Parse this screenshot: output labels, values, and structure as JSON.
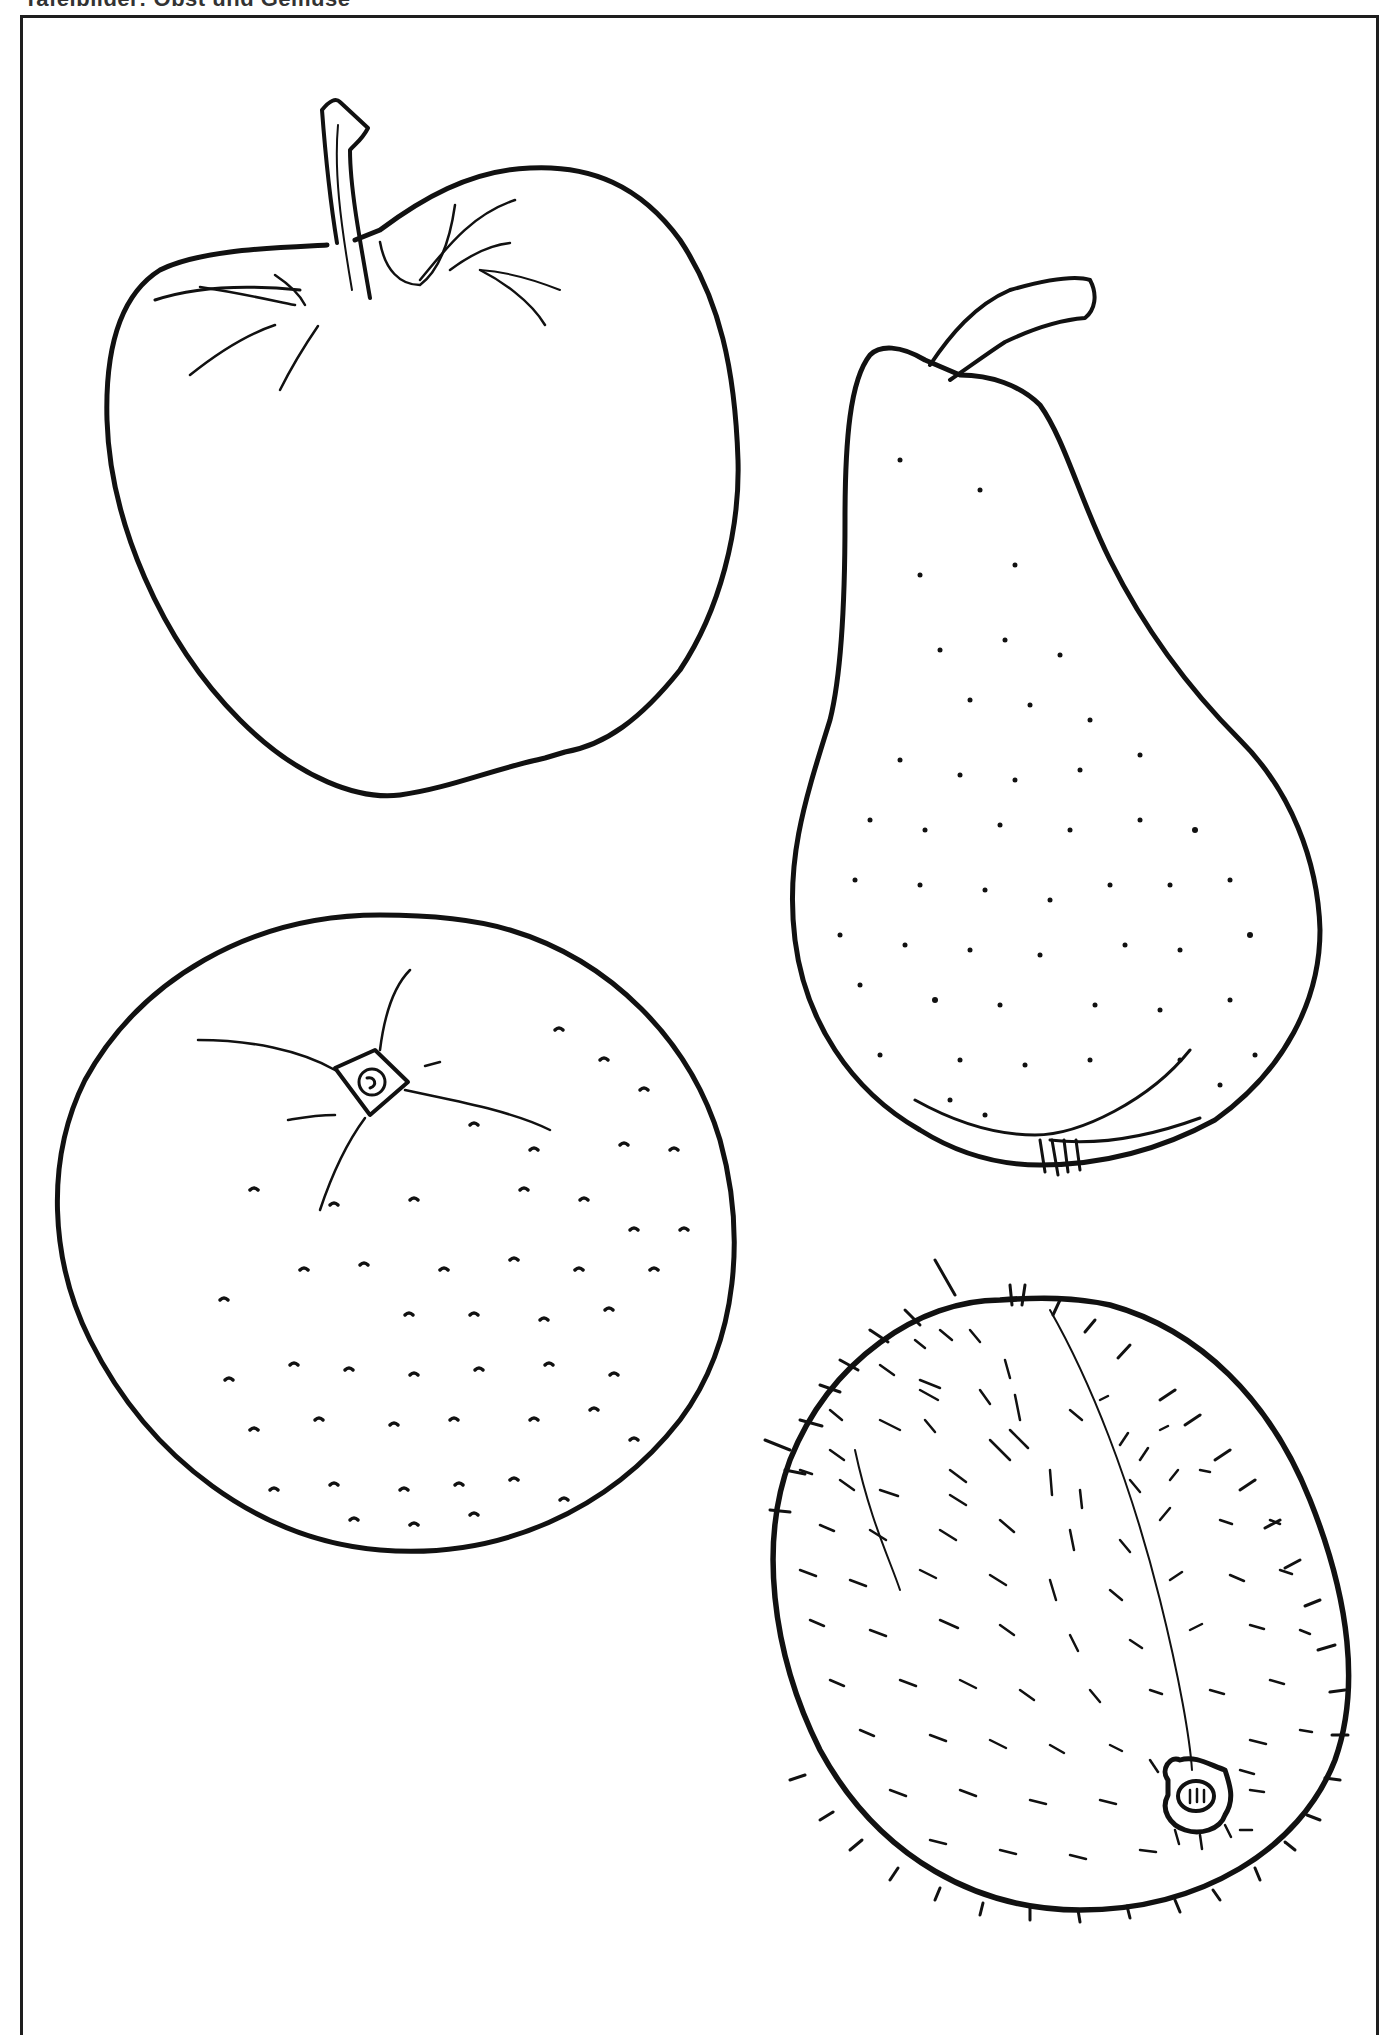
{
  "header": {
    "title": "Tafelbilder: Obst und Gemüse"
  },
  "illustration": {
    "style": "black line-art coloring page",
    "colors": {
      "ink": "#111111",
      "paper": "#ffffff",
      "frame": "#1e1e1e"
    },
    "fruits": [
      {
        "id": "apple",
        "label": "Apple"
      },
      {
        "id": "pear",
        "label": "Pear"
      },
      {
        "id": "orange",
        "label": "Orange"
      },
      {
        "id": "kiwi",
        "label": "Kiwi"
      }
    ]
  }
}
